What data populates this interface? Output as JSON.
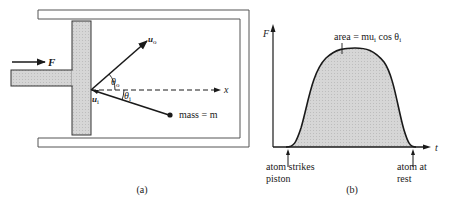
{
  "figure": {
    "panel_a": {
      "caption": "(a)",
      "force_label": "F",
      "outgoing_velocity": {
        "symbol": "u",
        "subscript": "o"
      },
      "incoming_velocity": {
        "symbol": "u",
        "subscript": "i"
      },
      "angle_out": {
        "symbol": "θ",
        "subscript": "o"
      },
      "angle_in": {
        "symbol": "θ",
        "subscript": "i"
      },
      "axis_label": "x",
      "mass_label": "mass = m"
    },
    "panel_b": {
      "caption": "(b)",
      "y_axis_label": "F",
      "x_axis_label": "t",
      "area_label": "area = mu",
      "area_label_sub": "i",
      "area_label_tail": " cos θ",
      "area_label_tail_sub": "i",
      "start_annotation_line1": "atom strikes",
      "start_annotation_line2": "piston",
      "end_annotation_line1": "atom at",
      "end_annotation_line2": "rest"
    },
    "colors": {
      "ink": "#1a1a1a",
      "fill_gray": "#d4d4d4",
      "container": "#555555"
    }
  }
}
